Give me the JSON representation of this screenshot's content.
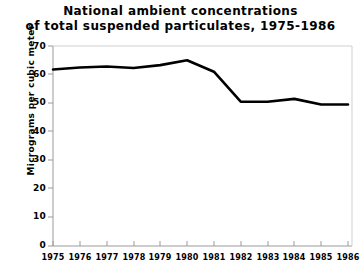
{
  "chart_data": {
    "type": "line",
    "title": "National ambient concentrations of total suspended particulates, 1975-1986",
    "title_lines": [
      "National ambient concentrations",
      "of total suspended particulates, 1975-1986"
    ],
    "xlabel": "",
    "ylabel": "Micrograms per cubic meter",
    "categories": [
      "1975",
      "1976",
      "1977",
      "1978",
      "1979",
      "1980",
      "1981",
      "1982",
      "1983",
      "1984",
      "1985",
      "1986"
    ],
    "x": [
      1975,
      1976,
      1977,
      1978,
      1979,
      1980,
      1981,
      1982,
      1983,
      1984,
      1985,
      1986
    ],
    "values": [
      61.8,
      62.5,
      62.8,
      62.3,
      63.3,
      65.0,
      61.0,
      50.5,
      50.5,
      51.5,
      49.5,
      49.5
    ],
    "series": [
      {
        "name": "Total suspended particulates",
        "values": [
          61.8,
          62.5,
          62.8,
          62.3,
          63.3,
          65.0,
          61.0,
          50.5,
          50.5,
          51.5,
          49.5,
          49.5
        ],
        "color": "#000000"
      }
    ],
    "ylim": [
      0,
      70
    ],
    "yticks": [
      0,
      10,
      20,
      30,
      40,
      50,
      60,
      70
    ],
    "ytick_labels": [
      "0",
      "10",
      "20",
      "30",
      "40",
      "50",
      "60",
      "70"
    ],
    "xtick_labels": [
      "1975",
      "1976",
      "1977",
      "1978",
      "1979",
      "1980",
      "1981",
      "1982",
      "1983",
      "1984",
      "1985",
      "1986"
    ],
    "grid": false,
    "legend": false,
    "legend_position": "none",
    "line_color": "#000000",
    "axis_color": "#9a9a9a",
    "background_color": "#ffffff"
  }
}
